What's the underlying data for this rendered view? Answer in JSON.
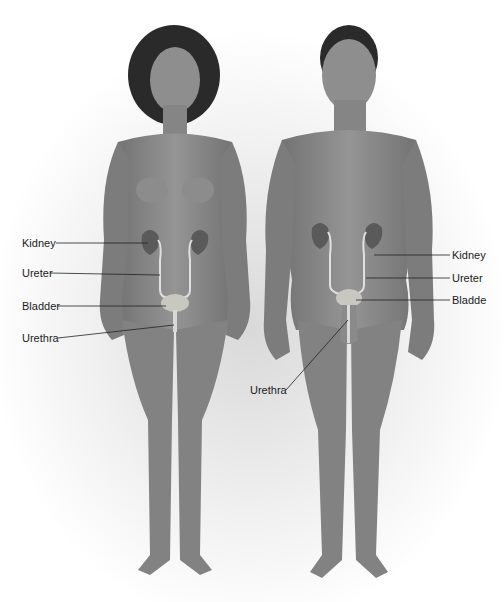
{
  "diagram": {
    "figures": [
      {
        "name": "female",
        "labels": [
          {
            "text": "Kidney",
            "x": 22,
            "y": 237
          },
          {
            "text": "Ureter",
            "x": 22,
            "y": 267
          },
          {
            "text": "Bladder",
            "x": 22,
            "y": 300
          },
          {
            "text": "Urethra",
            "x": 22,
            "y": 332
          }
        ]
      },
      {
        "name": "male",
        "labels": [
          {
            "text": "Kidney",
            "x": 452,
            "y": 250
          },
          {
            "text": "Ureter",
            "x": 452,
            "y": 272
          },
          {
            "text": "Bladde",
            "x": 452,
            "y": 295
          },
          {
            "text": "Urethra",
            "x": 250,
            "y": 384
          }
        ]
      }
    ],
    "colors": {
      "skin": "#8a8a8a",
      "skin_dark": "#6a6a6a",
      "hair": "#2a2a2a",
      "kidney": "#5a5a5a",
      "bladder": "#c8c8c0",
      "ureter": "#e0e0e0",
      "leader_line": "#222222"
    }
  }
}
